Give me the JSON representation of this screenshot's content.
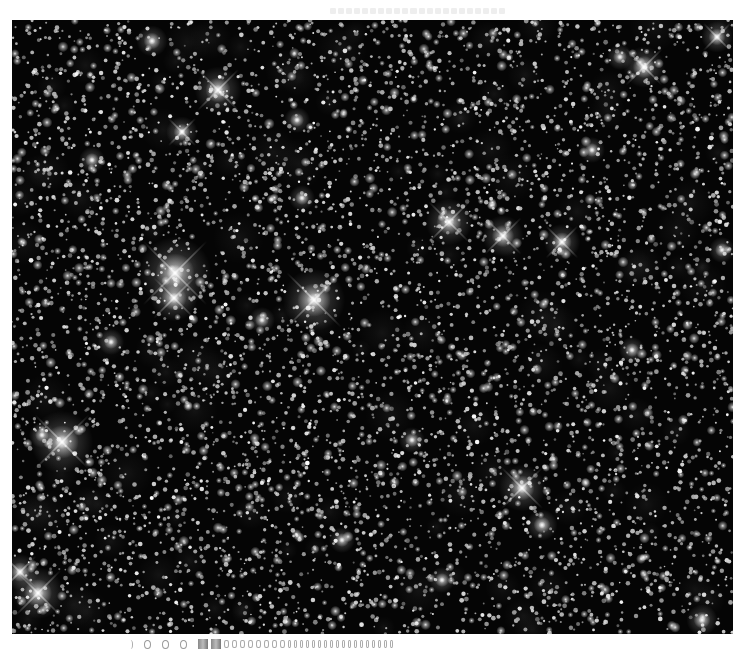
{
  "image": {
    "subject": "dense star field",
    "frame": {
      "x": 12,
      "y": 20,
      "width": 721,
      "height": 614
    },
    "background_color": "#050505",
    "page_background": "#ffffff",
    "star_color": "#ffffff",
    "random_seed": 7319,
    "faint_star_count": 5200,
    "medium_star_count": 900,
    "bright_stars": [
      {
        "x": 163,
        "y": 253,
        "r": 14,
        "spikes": true
      },
      {
        "x": 162,
        "y": 278,
        "r": 9,
        "spikes": true
      },
      {
        "x": 302,
        "y": 280,
        "r": 12,
        "spikes": true
      },
      {
        "x": 50,
        "y": 422,
        "r": 12,
        "spikes": true
      },
      {
        "x": 26,
        "y": 573,
        "r": 10,
        "spikes": true
      },
      {
        "x": 8,
        "y": 552,
        "r": 7,
        "spikes": true
      },
      {
        "x": 206,
        "y": 70,
        "r": 9,
        "spikes": true
      },
      {
        "x": 437,
        "y": 202,
        "r": 9,
        "spikes": true
      },
      {
        "x": 491,
        "y": 216,
        "r": 8,
        "spikes": true
      },
      {
        "x": 550,
        "y": 222,
        "r": 7,
        "spikes": true
      },
      {
        "x": 510,
        "y": 468,
        "r": 9,
        "spikes": true
      },
      {
        "x": 632,
        "y": 47,
        "r": 8,
        "spikes": true
      },
      {
        "x": 608,
        "y": 37,
        "r": 5,
        "spikes": false
      },
      {
        "x": 705,
        "y": 17,
        "r": 6,
        "spikes": true
      },
      {
        "x": 140,
        "y": 21,
        "r": 6,
        "spikes": false
      },
      {
        "x": 170,
        "y": 112,
        "r": 6,
        "spikes": true
      },
      {
        "x": 290,
        "y": 178,
        "r": 5,
        "spikes": false
      },
      {
        "x": 99,
        "y": 322,
        "r": 5,
        "spikes": false
      },
      {
        "x": 30,
        "y": 415,
        "r": 5,
        "spikes": false
      },
      {
        "x": 690,
        "y": 600,
        "r": 6,
        "spikes": false
      },
      {
        "x": 285,
        "y": 100,
        "r": 5,
        "spikes": false
      },
      {
        "x": 400,
        "y": 420,
        "r": 5,
        "spikes": false
      },
      {
        "x": 530,
        "y": 505,
        "r": 6,
        "spikes": false
      },
      {
        "x": 250,
        "y": 300,
        "r": 5,
        "spikes": false
      },
      {
        "x": 80,
        "y": 140,
        "r": 5,
        "spikes": false
      },
      {
        "x": 620,
        "y": 330,
        "r": 5,
        "spikes": false
      },
      {
        "x": 710,
        "y": 230,
        "r": 5,
        "spikes": false
      },
      {
        "x": 430,
        "y": 560,
        "r": 5,
        "spikes": false
      },
      {
        "x": 330,
        "y": 520,
        "r": 5,
        "spikes": false
      },
      {
        "x": 580,
        "y": 130,
        "r": 5,
        "spikes": false
      }
    ]
  },
  "header_strip": {
    "segments": 22
  },
  "footer_strip": {
    "rings": 3,
    "blobs": 2,
    "ticks": 26
  }
}
